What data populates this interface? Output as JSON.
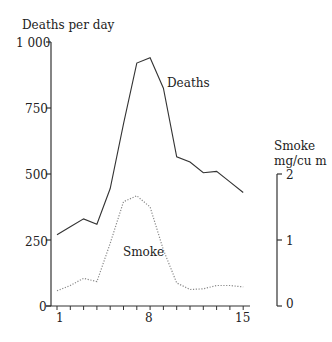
{
  "chart_data": {
    "type": "line",
    "title": "",
    "xlabel": "",
    "ylabel": "Deaths per day",
    "ylabel_right": "Smoke mg/cu m",
    "x": [
      1,
      2,
      3,
      4,
      5,
      6,
      7,
      8,
      9,
      10,
      11,
      12,
      13,
      14,
      15
    ],
    "x_ticks_labeled": [
      "1",
      "8",
      "15"
    ],
    "ylim": [
      0,
      1000
    ],
    "ylim_right": [
      0,
      2
    ],
    "y_ticks": [
      "1 000",
      "750",
      "500",
      "250",
      "0"
    ],
    "y_ticks_right": [
      "2",
      "1",
      "0"
    ],
    "series": [
      {
        "name": "Deaths",
        "axis": "left",
        "style": "solid",
        "values": [
          270,
          300,
          330,
          310,
          445,
          690,
          920,
          940,
          825,
          565,
          545,
          505,
          510,
          470,
          430
        ]
      },
      {
        "name": "Smoke",
        "axis": "right",
        "style": "dotted",
        "values": [
          0.23,
          0.31,
          0.42,
          0.37,
          0.95,
          1.58,
          1.67,
          1.5,
          0.85,
          0.35,
          0.25,
          0.26,
          0.31,
          0.31,
          0.29
        ]
      }
    ],
    "annotations": [
      "Deaths",
      "Smoke"
    ],
    "grid": false,
    "legend": "none (inline labels)"
  },
  "labels": {
    "left_axis_title": "Deaths per day",
    "right_axis_title_line1": "Smoke",
    "right_axis_title_line2": "mg/cu m",
    "deaths_label": "Deaths",
    "smoke_label": "Smoke"
  },
  "left_ticks": [
    {
      "label": "1 000",
      "value": 1000
    },
    {
      "label": "750",
      "value": 750
    },
    {
      "label": "500",
      "value": 500
    },
    {
      "label": "250",
      "value": 250
    },
    {
      "label": "0",
      "value": 0
    }
  ],
  "right_ticks": [
    {
      "label": "2",
      "value": 2
    },
    {
      "label": "1",
      "value": 1
    },
    {
      "label": "0",
      "value": 0
    }
  ],
  "x_labels": [
    {
      "label": "1",
      "day": 1
    },
    {
      "label": "8",
      "day": 8
    },
    {
      "label": "15",
      "day": 15
    }
  ],
  "colors": {
    "deaths_line": "#333333",
    "smoke_line": "#888888",
    "axis": "#333333"
  }
}
